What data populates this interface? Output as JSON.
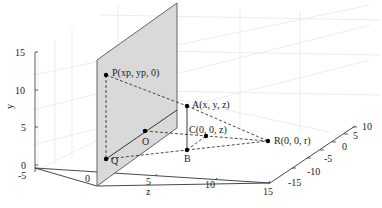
{
  "figure": {
    "type": "3d-perspective-projection-diagram",
    "axes": {
      "y": {
        "label": "y",
        "ticks": [
          "0",
          "5",
          "10",
          "15"
        ]
      },
      "x": {
        "label": "",
        "ticks": [
          "-5",
          "0"
        ]
      },
      "z": {
        "label": "z",
        "ticks": [
          "5",
          "10",
          "15"
        ]
      },
      "depth": {
        "ticks": [
          "10",
          "5",
          "0",
          "-5",
          "-10",
          "-15"
        ]
      }
    },
    "points": [
      {
        "id": "P",
        "label": "P(xp, yp, 0)"
      },
      {
        "id": "A",
        "label": "A(x, y, z)"
      },
      {
        "id": "C",
        "label": "C(0, 0, z)"
      },
      {
        "id": "R",
        "label": "R(0, 0, r)"
      },
      {
        "id": "O",
        "label": "O"
      },
      {
        "id": "B",
        "label": "B"
      },
      {
        "id": "Q",
        "label": "Q"
      }
    ],
    "colors": {
      "plane_fill": "#d9d9d9",
      "plane_edge": "#555555",
      "grid": "#e6e6e6",
      "axis": "#333333",
      "point": "#000000"
    }
  }
}
